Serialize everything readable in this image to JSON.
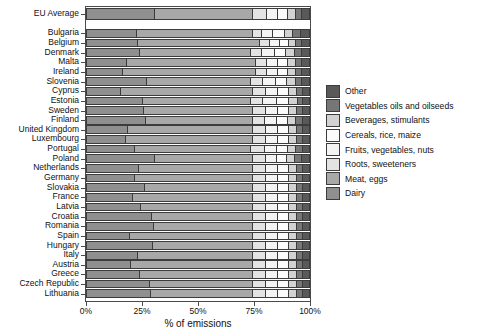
{
  "chart_data": {
    "type": "bar",
    "orientation": "horizontal",
    "stacked": true,
    "normalized": true,
    "title": "",
    "xlabel": "% of emissions",
    "ylabel": "",
    "xlim": [
      0,
      100
    ],
    "xticks": [
      0,
      25,
      50,
      75,
      100
    ],
    "xticklabels": [
      "0%",
      "25%",
      "50%",
      "75%",
      "100%"
    ],
    "grid": false,
    "legend_position": "right",
    "series": [
      {
        "name": "Dairy",
        "color": "#8f8f8f"
      },
      {
        "name": "Meat, eggs",
        "color": "#a8a8a8"
      },
      {
        "name": "Roots, sweeteners",
        "color": "#e3e3e3"
      },
      {
        "name": "Fruits, vegetables, nuts",
        "color": "#f4f4f4"
      },
      {
        "name": "Cereals, rice, maize",
        "color": "#fbfbfb"
      },
      {
        "name": "Beverages, stimulants",
        "color": "#d2d2d2"
      },
      {
        "name": "Vegetables oils and oilseeds",
        "color": "#767676"
      },
      {
        "name": "Other",
        "color": "#595959"
      }
    ],
    "legend_order": [
      "Other",
      "Vegetables oils and oilseeds",
      "Beverages, stimulants",
      "Cereals, rice, maize",
      "Fruits, vegetables, nuts",
      "Roots, sweeteners",
      "Meat, eggs",
      "Dairy"
    ],
    "legend_colors": [
      "#595959",
      "#767676",
      "#d2d2d2",
      "#fbfbfb",
      "#f4f4f4",
      "#e3e3e3",
      "#a8a8a8",
      "#8f8f8f"
    ],
    "average_row": {
      "label": "EU Average",
      "values": [
        30.5,
        44.5,
        6.0,
        5.0,
        4.5,
        3.5,
        3.0,
        3.0
      ]
    },
    "categories": [
      "Bulgaria",
      "Belgium",
      "Denmark",
      "Malta",
      "Ireland",
      "Slovenia",
      "Cyprus",
      "Estonia",
      "Sweden",
      "Finland",
      "United Kingdom",
      "Luxembourg",
      "Portugal",
      "Poland",
      "Netherlands",
      "Germany",
      "Slovakia",
      "France",
      "Latvia",
      "Croatia",
      "Romania",
      "Spain",
      "Hungary",
      "Italy",
      "Austria",
      "Greece",
      "Czech Republic",
      "Lithuania"
    ],
    "rows": [
      {
        "label": "Bulgaria",
        "values": [
          22.5,
          52.5,
          4.0,
          5.0,
          5.0,
          4.0,
          3.5,
          3.5
        ]
      },
      {
        "label": "Belgium",
        "values": [
          23.0,
          55.0,
          4.5,
          4.5,
          4.0,
          3.0,
          3.0,
          3.0
        ]
      },
      {
        "label": "Denmark",
        "values": [
          24.0,
          50.0,
          5.0,
          5.5,
          5.0,
          4.0,
          3.5,
          3.0
        ]
      },
      {
        "label": "Malta",
        "values": [
          18.0,
          58.0,
          5.0,
          5.0,
          4.5,
          3.5,
          3.0,
          3.0
        ]
      },
      {
        "label": "Ireland",
        "values": [
          16.0,
          60.0,
          5.0,
          5.0,
          4.5,
          3.5,
          3.0,
          3.0
        ]
      },
      {
        "label": "Slovenia",
        "values": [
          27.0,
          47.0,
          5.5,
          5.5,
          5.0,
          4.0,
          3.0,
          3.0
        ]
      },
      {
        "label": "Cyprus",
        "values": [
          15.5,
          59.5,
          5.5,
          5.5,
          5.0,
          3.5,
          3.0,
          2.5
        ]
      },
      {
        "label": "Estonia",
        "values": [
          25.0,
          49.0,
          5.5,
          6.0,
          5.5,
          4.0,
          2.5,
          2.5
        ]
      },
      {
        "label": "Sweden",
        "values": [
          25.5,
          49.5,
          5.5,
          5.5,
          5.0,
          3.5,
          2.8,
          2.7
        ]
      },
      {
        "label": "Finland",
        "values": [
          26.5,
          48.5,
          5.0,
          5.5,
          5.0,
          3.8,
          2.8,
          2.9
        ]
      },
      {
        "label": "United Kingdom",
        "values": [
          18.5,
          56.5,
          5.5,
          5.5,
          5.0,
          3.5,
          2.8,
          2.7
        ]
      },
      {
        "label": "Luxembourg",
        "values": [
          17.5,
          57.5,
          5.5,
          5.5,
          5.0,
          3.5,
          2.8,
          2.7
        ]
      },
      {
        "label": "Portugal",
        "values": [
          21.5,
          52.5,
          6.0,
          5.5,
          5.0,
          3.8,
          3.0,
          2.7
        ]
      },
      {
        "label": "Poland",
        "values": [
          30.5,
          44.5,
          5.5,
          5.0,
          4.8,
          3.6,
          3.0,
          3.1
        ]
      },
      {
        "label": "Netherlands",
        "values": [
          23.5,
          51.5,
          5.5,
          5.5,
          5.0,
          3.6,
          2.8,
          2.6
        ]
      },
      {
        "label": "Germany",
        "values": [
          21.5,
          53.5,
          5.5,
          5.5,
          5.0,
          3.6,
          2.8,
          2.6
        ]
      },
      {
        "label": "Slovakia",
        "values": [
          26.0,
          49.0,
          5.5,
          5.5,
          5.0,
          3.6,
          2.8,
          2.6
        ]
      },
      {
        "label": "France",
        "values": [
          20.5,
          54.5,
          5.5,
          5.5,
          5.0,
          3.6,
          2.8,
          2.6
        ]
      },
      {
        "label": "Latvia",
        "values": [
          24.5,
          50.5,
          5.5,
          5.5,
          5.0,
          3.6,
          2.8,
          2.6
        ]
      },
      {
        "label": "Croatia",
        "values": [
          29.5,
          45.5,
          5.5,
          5.5,
          5.0,
          3.6,
          2.8,
          2.6
        ]
      },
      {
        "label": "Romania",
        "values": [
          30.0,
          45.0,
          5.5,
          5.5,
          5.0,
          3.6,
          2.8,
          2.6
        ]
      },
      {
        "label": "Spain",
        "values": [
          19.5,
          55.5,
          5.5,
          5.5,
          5.0,
          3.6,
          2.8,
          2.6
        ]
      },
      {
        "label": "Hungary",
        "values": [
          29.8,
          45.2,
          5.5,
          5.5,
          5.0,
          3.6,
          2.8,
          2.6
        ]
      },
      {
        "label": "Italy",
        "values": [
          23.0,
          52.0,
          5.5,
          5.5,
          5.0,
          3.6,
          2.8,
          2.6
        ]
      },
      {
        "label": "Austria",
        "values": [
          19.8,
          55.2,
          5.5,
          5.5,
          5.0,
          3.6,
          2.8,
          2.6
        ]
      },
      {
        "label": "Greece",
        "values": [
          24.0,
          51.0,
          5.5,
          5.5,
          5.0,
          3.6,
          2.8,
          2.6
        ]
      },
      {
        "label": "Czech Republic",
        "values": [
          28.5,
          46.5,
          5.5,
          5.5,
          5.0,
          3.6,
          2.8,
          2.6
        ]
      },
      {
        "label": "Lithuania",
        "values": [
          29.0,
          46.0,
          5.5,
          5.5,
          5.0,
          3.6,
          2.8,
          2.6
        ]
      }
    ]
  }
}
